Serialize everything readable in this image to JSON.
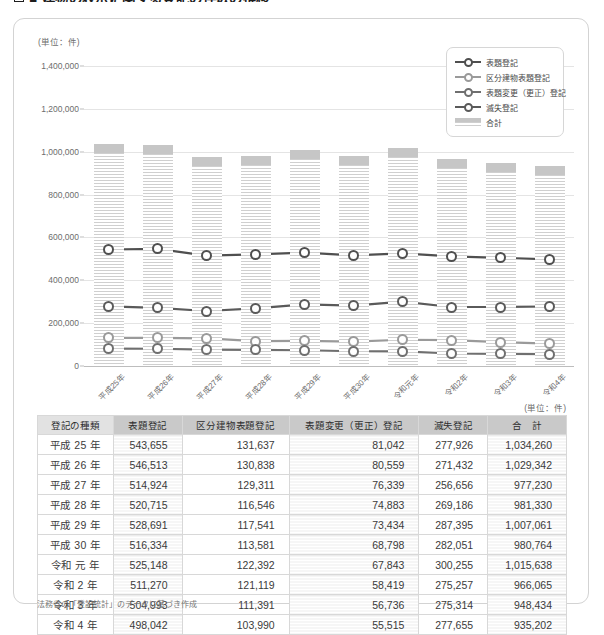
{
  "page": {
    "heading": "■ 建物の表示に関する登記の件数の推移"
  },
  "chart": {
    "unit_label": "(単位：件)",
    "legend": [
      {
        "label": "表題登記",
        "color": "#4f4f4f",
        "type": "line"
      },
      {
        "label": "区分建物表題登記",
        "color": "#9a9a9a",
        "type": "line"
      },
      {
        "label": "表題変更（更正）登記",
        "color": "#6f6f6f",
        "type": "line"
      },
      {
        "label": "滅失登記",
        "color": "#5a5a5a",
        "type": "line"
      },
      {
        "label": "合計",
        "color": "#c6c6c6",
        "type": "bar"
      }
    ]
  },
  "chart_data": {
    "type": "bar",
    "title": "建物の表示に関する登記の件数の推移",
    "xlabel": "",
    "ylabel": "",
    "unit": "件",
    "ylim": [
      0,
      1400000
    ],
    "yticks": [
      0,
      200000,
      400000,
      600000,
      800000,
      1000000,
      1200000,
      1400000
    ],
    "ytick_labels": [
      "0",
      "200,000",
      "400,000",
      "600,000",
      "800,000",
      "1,000,000",
      "1,200,000",
      "1,400,000"
    ],
    "grid": true,
    "legend_position": "top-right",
    "categories": [
      "平成25年",
      "平成26年",
      "平成27年",
      "平成28年",
      "平成29年",
      "平成30年",
      "令和元年",
      "令和2年",
      "令和3年",
      "令和4年"
    ],
    "series": [
      {
        "name": "合計",
        "type": "bar",
        "color": "#c6c6c6",
        "values": [
          1034260,
          1029342,
          977230,
          981330,
          1007061,
          980764,
          1015638,
          966065,
          948434,
          935202
        ]
      },
      {
        "name": "表題登記",
        "type": "line",
        "color": "#4f4f4f",
        "values": [
          543655,
          546513,
          514924,
          520715,
          528691,
          516334,
          525148,
          511270,
          504993,
          498042
        ]
      },
      {
        "name": "区分建物表題登記",
        "type": "line",
        "color": "#9a9a9a",
        "values": [
          131637,
          130838,
          129311,
          116546,
          117541,
          113581,
          122392,
          121119,
          111391,
          103990
        ]
      },
      {
        "name": "表題変更（更正）登記",
        "type": "line",
        "color": "#6f6f6f",
        "values": [
          81042,
          80559,
          76339,
          74883,
          73434,
          68798,
          67843,
          58419,
          56736,
          55515
        ]
      },
      {
        "name": "滅失登記",
        "type": "line",
        "color": "#5a5a5a",
        "values": [
          277926,
          271432,
          256656,
          269186,
          287395,
          282051,
          300255,
          275257,
          275314,
          277655
        ]
      }
    ]
  },
  "table": {
    "unit_label": "(単位：件)",
    "headers": [
      "登記の種類",
      "表題登記",
      "区分建物表題登記",
      "表題変更（更正）登記",
      "滅失登記",
      "合　計"
    ],
    "rows": [
      {
        "year": "平成 25 年",
        "values": [
          "543,655",
          "131,637",
          "81,042",
          "277,926",
          "1,034,260"
        ]
      },
      {
        "year": "平成 26 年",
        "values": [
          "546,513",
          "130,838",
          "80,559",
          "271,432",
          "1,029,342"
        ]
      },
      {
        "year": "平成 27 年",
        "values": [
          "514,924",
          "129,311",
          "76,339",
          "256,656",
          "977,230"
        ]
      },
      {
        "year": "平成 28 年",
        "values": [
          "520,715",
          "116,546",
          "74,883",
          "269,186",
          "981,330"
        ]
      },
      {
        "year": "平成 29 年",
        "values": [
          "528,691",
          "117,541",
          "73,434",
          "287,395",
          "1,007,061"
        ]
      },
      {
        "year": "平成 30 年",
        "values": [
          "516,334",
          "113,581",
          "68,798",
          "282,051",
          "980,764"
        ]
      },
      {
        "year": "令和 元 年",
        "values": [
          "525,148",
          "122,392",
          "67,843",
          "300,255",
          "1,015,638"
        ]
      },
      {
        "year": "令和 2 年",
        "values": [
          "511,270",
          "121,119",
          "58,419",
          "275,257",
          "966,065"
        ]
      },
      {
        "year": "令和 3 年",
        "values": [
          "504,993",
          "111,391",
          "56,736",
          "275,314",
          "948,434"
        ]
      },
      {
        "year": "令和 4 年",
        "values": [
          "498,042",
          "103,990",
          "55,515",
          "277,655",
          "935,202"
        ]
      }
    ]
  },
  "footnote": "法務省の「登記統計」のデータに基づき作成"
}
